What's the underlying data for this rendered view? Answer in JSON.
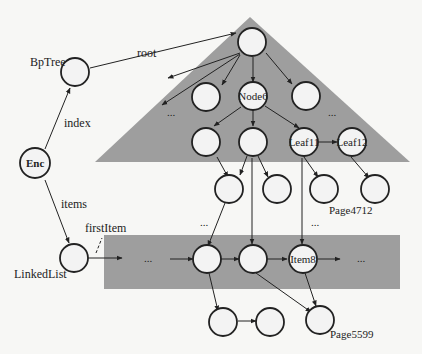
{
  "colors": {
    "background": "#f7f7f5",
    "region": "#9e9e9e",
    "node_fill": "#f3f3f3",
    "stroke": "#222222"
  },
  "labels": {
    "bptree": "BpTree",
    "root": "root",
    "index": "index",
    "enc": "Enc",
    "items": "items",
    "linkedlist": "LinkedList",
    "firstitem": "firstItem",
    "node6": "Node6",
    "leaf11": "Leaf11",
    "leaf12": "Leaf12",
    "page4712": "Page4712",
    "item8": "Item8",
    "page5599": "Page5599",
    "ellipsis": "..."
  }
}
